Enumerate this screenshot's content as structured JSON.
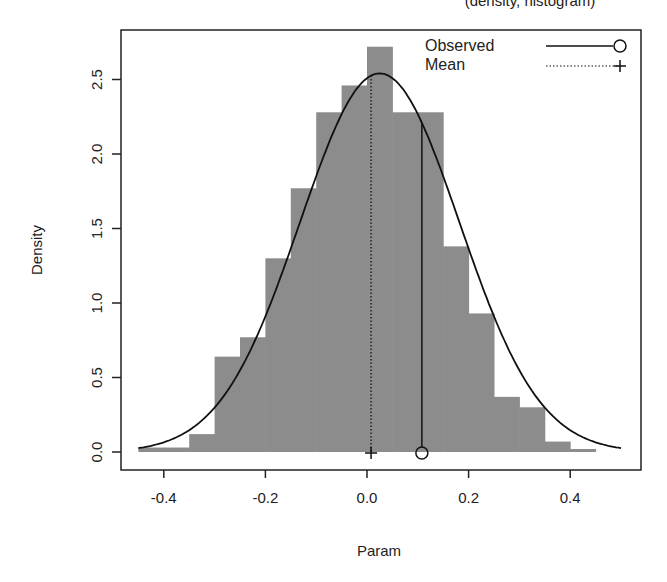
{
  "chart_data": {
    "type": "bar",
    "subtype": "histogram-with-density",
    "title": "(density, histogram)",
    "title_visible_fragment": "...ity, ...ogr...)",
    "xlabel": "Param",
    "ylabel": "Density",
    "xlim": [
      -0.5,
      0.53
    ],
    "ylim": [
      0,
      2.78
    ],
    "x_ticks": [
      -0.4,
      -0.2,
      0.0,
      0.2,
      0.4
    ],
    "x_tick_labels": [
      "-0.4",
      "-0.2",
      "0.0",
      "0.2",
      "0.4"
    ],
    "y_ticks": [
      0.0,
      0.5,
      1.0,
      1.5,
      2.0,
      2.5
    ],
    "y_tick_labels": [
      "0.0",
      "0.5",
      "1.0",
      "1.5",
      "2.0",
      "2.5"
    ],
    "grid": false,
    "bin_width": 0.05,
    "bins": [
      {
        "from": -0.45,
        "to": -0.4,
        "density": 0.03
      },
      {
        "from": -0.4,
        "to": -0.35,
        "density": 0.03
      },
      {
        "from": -0.35,
        "to": -0.3,
        "density": 0.12
      },
      {
        "from": -0.3,
        "to": -0.25,
        "density": 0.64
      },
      {
        "from": -0.25,
        "to": -0.2,
        "density": 0.77
      },
      {
        "from": -0.2,
        "to": -0.15,
        "density": 1.3
      },
      {
        "from": -0.15,
        "to": -0.1,
        "density": 1.77
      },
      {
        "from": -0.1,
        "to": -0.05,
        "density": 2.28
      },
      {
        "from": -0.05,
        "to": 0.0,
        "density": 2.46
      },
      {
        "from": 0.0,
        "to": 0.05,
        "density": 2.72
      },
      {
        "from": 0.05,
        "to": 0.1,
        "density": 2.28
      },
      {
        "from": 0.1,
        "to": 0.15,
        "density": 2.28
      },
      {
        "from": 0.15,
        "to": 0.2,
        "density": 1.38
      },
      {
        "from": 0.2,
        "to": 0.25,
        "density": 0.93
      },
      {
        "from": 0.25,
        "to": 0.3,
        "density": 0.37
      },
      {
        "from": 0.3,
        "to": 0.35,
        "density": 0.3
      },
      {
        "from": 0.35,
        "to": 0.4,
        "density": 0.07
      },
      {
        "from": 0.4,
        "to": 0.45,
        "density": 0.02
      }
    ],
    "density_curve": {
      "description": "Approximately normal density overlay",
      "x_range": [
        -0.45,
        0.5
      ],
      "peak_x": 0.025,
      "peak_density": 2.54,
      "sd_approx": 0.157
    },
    "markers": {
      "observed": {
        "x": 0.108,
        "density_at_x": 2.2,
        "symbol": "open-circle",
        "line": "solid"
      },
      "mean": {
        "x": 0.008,
        "symbol": "plus",
        "line": "dotted",
        "line_top_density": 2.54
      }
    },
    "legend": {
      "position": "top-right",
      "entries": [
        {
          "label": "Observed",
          "line": "solid",
          "symbol": "open-circle"
        },
        {
          "label": "Mean",
          "line": "dotted",
          "symbol": "plus"
        }
      ]
    },
    "colors": {
      "bar_fill": "#8c8c8c",
      "line": "#111111",
      "axis": "#222222"
    }
  },
  "legend": {
    "observed_label": "Observed",
    "mean_label": "Mean"
  },
  "axes": {
    "xlabel": "Param",
    "ylabel": "Density"
  },
  "title": {
    "text": "(density, histogram)"
  }
}
